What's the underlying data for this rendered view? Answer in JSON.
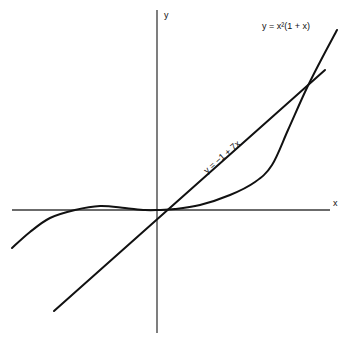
{
  "chart_data": {
    "type": "line",
    "title": "",
    "xlabel": "x",
    "ylabel": "y",
    "grid": false,
    "legend": "none (inline curve labels)",
    "series": [
      {
        "name": "y = x²(1 + x)",
        "label": "y = x²(1 + x)",
        "kind": "cubic",
        "x": [
          -1.7,
          -1.0,
          -0.667,
          0,
          0.5,
          1.0,
          1.5,
          1.9
        ],
        "y": [
          -1.2,
          0,
          0.148,
          0,
          0.375,
          2.0,
          5.6,
          10.5
        ]
      },
      {
        "name": "y = −1 + 7x",
        "label": "y = −1 + 7x",
        "kind": "linear",
        "x": [
          -1.2,
          0,
          0.143,
          1.9
        ],
        "y": [
          -9.4,
          -1,
          0,
          12.3
        ]
      }
    ],
    "annotations": [
      "y = x²(1 + x)",
      "y = −1 + 7x"
    ],
    "intersections": "line crosses cubic near x≈0.15 and x≈2.1"
  },
  "pixels": {
    "x_axis": {
      "x1": 12,
      "x2": 330,
      "y": 210
    },
    "y_axis": {
      "x": 157,
      "y1": 10,
      "y2": 333
    },
    "cubic_path": [
      [
        12,
        248
      ],
      [
        30,
        232
      ],
      [
        50,
        218
      ],
      [
        75,
        210
      ],
      [
        100,
        206
      ],
      [
        125,
        208
      ],
      [
        145,
        210
      ],
      [
        157,
        210
      ],
      [
        175,
        209
      ],
      [
        200,
        205
      ],
      [
        230,
        195
      ],
      [
        255,
        182
      ],
      [
        272,
        165
      ],
      [
        288,
        130
      ],
      [
        305,
        92
      ],
      [
        320,
        62
      ],
      [
        337,
        30
      ]
    ],
    "line_path": [
      [
        54,
        311
      ],
      [
        325,
        70
      ]
    ],
    "labels": {
      "y_axis": {
        "x": 164,
        "y": 18
      },
      "x_axis": {
        "x": 333,
        "y": 206
      },
      "cubic": {
        "x": 262,
        "y": 29
      },
      "line": {
        "x": 207,
        "y": 174,
        "angle": -41
      }
    }
  }
}
